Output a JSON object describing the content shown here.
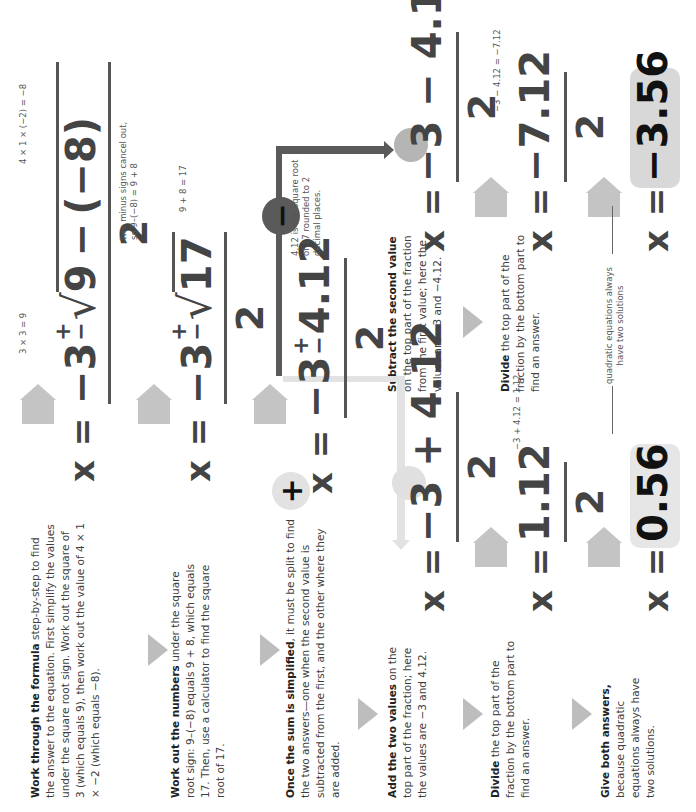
{
  "steps": [
    {
      "id": "work-through",
      "bold": "Work through the formula",
      "text": " step-by-step to find the answer to the equation. First simplify the values under the square root sign. Work out the square of 3 (which equals 9), then work out the value of 4 × 1 × −2 (which equals −8)."
    },
    {
      "id": "work-out-numbers",
      "bold": "Work out the numbers",
      "text": " under the square root sign: 9–(−8) equals 9 + 8, which equals 17. Then, use a calculator to find the square root of 17."
    },
    {
      "id": "once-simplified",
      "bold": "Once the sum is simplified",
      "text": ", it must be split to find the two answers—one when the second value is subtracted from the first, and the other where they are added."
    },
    {
      "id": "add-values",
      "bold": "Add the two values",
      "text": " on the top part of the fraction; here the values are −3 and 4.12."
    },
    {
      "id": "subtract-value",
      "bold": "Subtract the second value",
      "text": " on the top part of the fraction from the first value; here the values are −3 and −4.12."
    },
    {
      "id": "divide-plus",
      "bold": "Divide",
      "text": " the top part of the fraction by the bottom part to find an answer."
    },
    {
      "id": "divide-minus",
      "bold": "Divide",
      "text": " the top part of the fraction by the bottom part to find an answer."
    },
    {
      "id": "give-both",
      "bold": "Give both answers,",
      "text": " because quadratic equations always have two solutions."
    }
  ],
  "equations": {
    "eq1": {
      "lhs": "x =",
      "a": "−3",
      "pm_top": "+",
      "pm_bot": "−",
      "radicand_a": "9",
      "minus": "−",
      "radicand_b": "(−8)",
      "den": "2"
    },
    "eq2": {
      "lhs": "x =",
      "a": "−3",
      "pm_top": "+",
      "pm_bot": "−",
      "radicand": "17",
      "den": "2"
    },
    "eq3": {
      "lhs": "x =",
      "a": "−3",
      "pm_top": "+",
      "pm_bot": "−",
      "b": "4.12",
      "den": "2"
    },
    "eq_plus": {
      "lhs": "x =",
      "a": "−3",
      "op": "+",
      "b": "4.12",
      "den": "2"
    },
    "eq_minus": {
      "lhs": "x =",
      "a": "−3",
      "op": "−",
      "b": "4.12",
      "den": "2"
    },
    "eq_plus_div": {
      "lhs": "x =",
      "num": "1.12",
      "den": "2"
    },
    "eq_minus_div": {
      "lhs": "x =",
      "num": "−7.12",
      "den": "2"
    },
    "ans_plus": {
      "lhs": "x =",
      "val": "0.56"
    },
    "ans_minus": {
      "lhs": "x =",
      "val": "−3.56"
    }
  },
  "notes": {
    "three_sq": "3 × 3 = 9",
    "four_ac": "4 × 1 × (−2) = −8",
    "minus_cancel_1": "two minus signs cancel out,",
    "minus_cancel_2": "so 9–(−8) = 9 + 8",
    "nine_plus_eight": "9 + 8 = 17",
    "sqrt17_1": "4.12 is the square root",
    "sqrt17_2": "of 17 rounded to 2",
    "sqrt17_3": "decimal places.",
    "plus_sum": "−3 + 4.12 = 1.12",
    "minus_sum": "−3 − 4.12 = −7.12",
    "two_solutions_1": "quadratic equations always",
    "two_solutions_2": "have two solutions"
  },
  "branches": {
    "plus_symbol": "+",
    "minus_symbol": "−",
    "plus_color": "#e2e2e2",
    "minus_color": "#5a5a5a"
  }
}
